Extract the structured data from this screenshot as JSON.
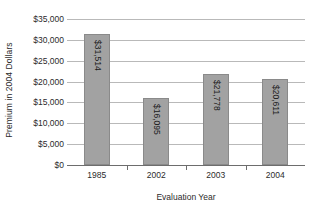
{
  "chart_data": {
    "type": "bar",
    "title": "",
    "xlabel": "Evaluation Year",
    "ylabel": "Premium in 2004 Dollars",
    "categories": [
      "1985",
      "2002",
      "2003",
      "2004"
    ],
    "values": [
      31514,
      16095,
      21778,
      20611
    ],
    "value_labels": [
      "$31,514",
      "$16,095",
      "$21,778",
      "$20,611"
    ],
    "ylim": [
      0,
      35000
    ],
    "ytick_values": [
      0,
      5000,
      10000,
      15000,
      20000,
      25000,
      30000,
      35000
    ],
    "ytick_labels": [
      "$0",
      "$5,000",
      "$10,000",
      "$15,000",
      "$20,000",
      "$25,000",
      "$30,000",
      "$35,000"
    ],
    "grid": true,
    "legend": false,
    "bar_color": "#a2a2a2",
    "bar_border_color": "#8a8a8a",
    "gridline_color": "#b9b9b9",
    "axis_color": "#6d6d6d"
  }
}
